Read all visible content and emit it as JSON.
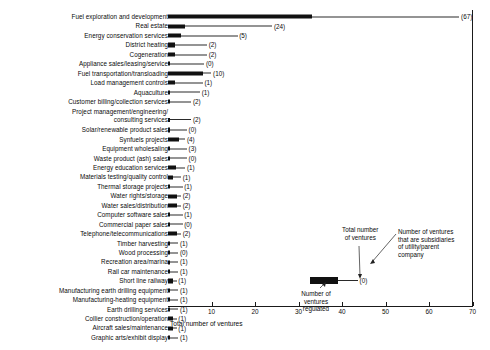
{
  "chart_data": {
    "type": "bar",
    "orientation": "horizontal",
    "title": "",
    "xlabel": "Total number of ventures",
    "ylabel": "",
    "xlim": [
      0,
      78
    ],
    "xticks": [
      10,
      20,
      30,
      40,
      50,
      60,
      70
    ],
    "grid": false,
    "legend_position": "inside-lower-right",
    "series": [
      {
        "name": "Number of ventures regulated",
        "style": "solid-black-bar"
      },
      {
        "name": "Total number of ventures",
        "style": "thin-line-extension"
      },
      {
        "name": "Number of ventures that are subsidiaries of utility/parent company",
        "style": "parenthetical-label"
      }
    ],
    "categories": [
      "Fuel exploration and development",
      "Real estate",
      "Energy conservation services",
      "District heating",
      "Cogeneration",
      "Appliance sales/leasing/service",
      "Fuel transportation/transloading",
      "Load management controls",
      "Aquaculture",
      "Customer billing/collection services",
      "Project management/engineering/\nconsulting services",
      "Solar/renewable product sales",
      "Synfuels projects",
      "Equipment wholesaling",
      "Waste product (ash) sales",
      "Energy education services",
      "Materials testing/quality control",
      "Thermal storage projects",
      "Water rights/storage",
      "Water sales/distribution",
      "Computer software sales",
      "Commercial paper sales",
      "Telephone/telecommunications",
      "Timber harvesting",
      "Wood processing",
      "Recreation area/marina",
      "Rail car maintenance",
      "Short line railway",
      "Manufacturing earth drilling equipment",
      "Manufacturing-heating equipment",
      "Earth drilling services",
      "Collier construction/operation",
      "Aircraft sales/maintenance",
      "Graphic arts/exhibit display"
    ],
    "total_ventures": [
      67,
      24,
      16,
      9,
      9,
      8,
      10,
      8,
      7,
      5,
      5,
      4,
      4,
      4,
      4,
      4,
      3,
      3,
      3,
      3,
      3,
      3,
      3,
      2,
      2,
      2,
      2,
      2,
      2,
      2,
      2,
      2,
      2,
      2
    ],
    "regulated": [
      33,
      4,
      3,
      1.5,
      1.5,
      0,
      8,
      1.5,
      0,
      0,
      0,
      0,
      2.5,
      0,
      0,
      1.8,
      1.2,
      0,
      2,
      2,
      0,
      0,
      2,
      0,
      0,
      0,
      0,
      1.2,
      0,
      0,
      0,
      1.2,
      1.2,
      0
    ],
    "subsidiaries": [
      67,
      24,
      5,
      2,
      2,
      0,
      10,
      1,
      1,
      2,
      2,
      0,
      4,
      3,
      0,
      1,
      1,
      1,
      2,
      2,
      1,
      0,
      2,
      1,
      0,
      1,
      1,
      1,
      1,
      1,
      1,
      1,
      1,
      1
    ],
    "subsidiary_labels": [
      "(67)",
      "(24)",
      "(5)",
      "(2)",
      "(2)",
      "(0)",
      "(10)",
      "(1)",
      "(1)",
      "(2)",
      "(2)",
      "(0)",
      "(4)",
      "(3)",
      "(0)",
      "(1)",
      "(1)",
      "(1)",
      "(2)",
      "(2)",
      "(1)",
      "(0)",
      "(2)",
      "(1)",
      "(0)",
      "(1)",
      "(1)",
      "(1)",
      "(1)",
      "(1)",
      "(1)",
      "(1)",
      "(1)",
      "(1)"
    ],
    "annotations": [
      {
        "name": "total-number-of-ventures",
        "text": "Total number\nof ventures"
      },
      {
        "name": "subsidiaries-note",
        "text": "Number of ventures\nthat are subsidiaries\nof utility/parent\ncompany"
      },
      {
        "name": "regulated-note",
        "text": "Number of\nventures\nregulated"
      }
    ],
    "sample_paren": "(0)"
  }
}
